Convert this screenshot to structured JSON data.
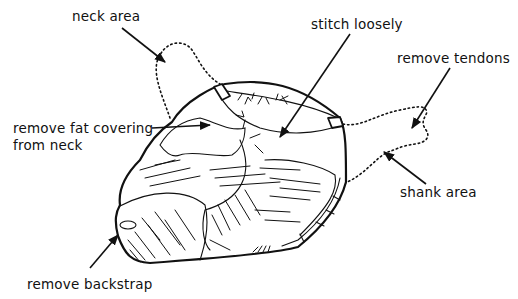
{
  "diagram": {
    "labels": {
      "neck_area": "neck area",
      "stitch_loosely": "stitch loosely",
      "remove_tendons": "remove tendons",
      "remove_fat_line1": "remove fat covering",
      "remove_fat_line2": "from neck",
      "shank_area": "shank area",
      "remove_backstrap": "remove backstrap"
    },
    "colors": {
      "ink": "#111111",
      "background": "#ffffff"
    }
  }
}
